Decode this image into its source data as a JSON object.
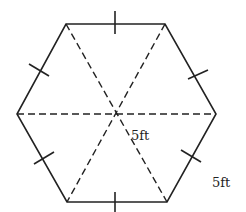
{
  "figure": {
    "shape": "regular hexagon",
    "colors": {
      "stroke": "#222222",
      "background": "#ffffff"
    },
    "vertices": [
      [
        66,
        24
      ],
      [
        165,
        24
      ],
      [
        216,
        114
      ],
      [
        167,
        202
      ],
      [
        67,
        202
      ],
      [
        17,
        114
      ]
    ],
    "center": [
      116,
      114
    ],
    "labels": {
      "radius_label": "5ft",
      "side_label": "5ft"
    }
  }
}
